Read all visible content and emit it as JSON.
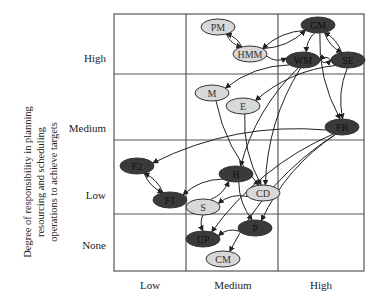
{
  "diagram": {
    "y_axis_title_lines": [
      "Degree of responsibility in planning",
      "resourcing and scheduling",
      "operations to achieve targets"
    ],
    "y_ticks": [
      "High",
      "Medium",
      "Low",
      "None"
    ],
    "x_ticks": [
      "Low",
      "Medium",
      "High"
    ],
    "nodes": [
      {
        "id": "PM",
        "label": "PM",
        "shade": "light",
        "cx": 218,
        "cy": 27
      },
      {
        "id": "HMM",
        "label": "HMM",
        "shade": "light",
        "cx": 250,
        "cy": 54
      },
      {
        "id": "GM",
        "label": "GM",
        "shade": "dark",
        "cx": 318,
        "cy": 25
      },
      {
        "id": "WM",
        "label": "WM",
        "shade": "dark",
        "cx": 303,
        "cy": 60
      },
      {
        "id": "SE",
        "label": "SE",
        "shade": "dark",
        "cx": 348,
        "cy": 60
      },
      {
        "id": "M",
        "label": "M",
        "shade": "light",
        "cx": 212,
        "cy": 93
      },
      {
        "id": "E",
        "label": "E",
        "shade": "light",
        "cx": 243,
        "cy": 106
      },
      {
        "id": "FR",
        "label": "FR",
        "shade": "dark",
        "cx": 342,
        "cy": 127
      },
      {
        "id": "F2",
        "label": "F2",
        "shade": "dark",
        "cx": 137,
        "cy": 166
      },
      {
        "id": "F1",
        "label": "F1",
        "shade": "dark",
        "cx": 170,
        "cy": 200
      },
      {
        "id": "H",
        "label": "H",
        "shade": "dark",
        "cx": 236,
        "cy": 174
      },
      {
        "id": "CD",
        "label": "CD",
        "shade": "light",
        "cx": 263,
        "cy": 193
      },
      {
        "id": "S",
        "label": "S",
        "shade": "light",
        "cx": 203,
        "cy": 207
      },
      {
        "id": "P",
        "label": "P",
        "shade": "dark",
        "cx": 255,
        "cy": 228
      },
      {
        "id": "UP",
        "label": "UP",
        "shade": "dark",
        "cx": 203,
        "cy": 239
      },
      {
        "id": "CM",
        "label": "CM",
        "shade": "light",
        "cx": 223,
        "cy": 259
      }
    ],
    "edges": [
      [
        "PM",
        "HMM"
      ],
      [
        "HMM",
        "PM"
      ],
      [
        "GM",
        "HMM"
      ],
      [
        "HMM",
        "GM"
      ],
      [
        "GM",
        "SE"
      ],
      [
        "SE",
        "GM"
      ],
      [
        "HMM",
        "WM"
      ],
      [
        "WM",
        "SE"
      ],
      [
        "SE",
        "WM"
      ],
      [
        "GM",
        "WM"
      ],
      [
        "GM",
        "FR"
      ],
      [
        "SE",
        "FR"
      ],
      [
        "WM",
        "M"
      ],
      [
        "SE",
        "E"
      ],
      [
        "FR",
        "F2"
      ],
      [
        "F1",
        "F2"
      ],
      [
        "F2",
        "F1"
      ],
      [
        "H",
        "F1"
      ],
      [
        "WM",
        "H"
      ],
      [
        "WM",
        "CD"
      ],
      [
        "CD",
        "S"
      ],
      [
        "S",
        "H"
      ],
      [
        "H",
        "P"
      ],
      [
        "P",
        "UP"
      ],
      [
        "S",
        "UP"
      ],
      [
        "FR",
        "P"
      ],
      [
        "FR",
        "UP"
      ],
      [
        "FR",
        "CM"
      ],
      [
        "M",
        "CD"
      ],
      [
        "E",
        "CD"
      ]
    ],
    "colors": {
      "dark_node": "#3a3a3a",
      "light_node": "#d8d8d8",
      "grid": "#555555",
      "edge": "#222222"
    }
  }
}
